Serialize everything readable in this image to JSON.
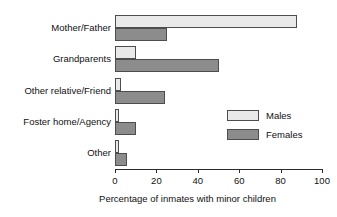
{
  "chart_data": {
    "type": "bar",
    "orientation": "horizontal",
    "title": "",
    "xlabel": "Percentage of inmates with minor children",
    "ylabel": "",
    "xlim": [
      0,
      100
    ],
    "xticks": [
      0,
      20,
      40,
      60,
      80,
      100
    ],
    "xtick_labels": [
      "0",
      "20",
      "40",
      "60",
      "80",
      "100"
    ],
    "grid": false,
    "legend_position": "center-right",
    "categories": [
      "Mother/Father",
      "Grandparents",
      "Other relative/Friend",
      "Foster home/Agency",
      "Other"
    ],
    "series": [
      {
        "name": "Males",
        "color": "#e9e9e9",
        "values": [
          88,
          10,
          3,
          2,
          2
        ]
      },
      {
        "name": "Females",
        "color": "#8c8c8c",
        "values": [
          25,
          50,
          24,
          10,
          6
        ]
      }
    ]
  },
  "legend": {
    "entries": [
      {
        "label": "Males",
        "swatch": "male"
      },
      {
        "label": "Females",
        "swatch": "female"
      }
    ]
  }
}
